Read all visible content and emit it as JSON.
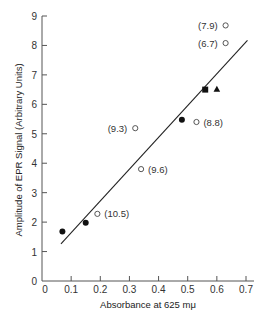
{
  "chart_data": {
    "type": "scatter",
    "title": "",
    "xlabel": "Absorbance at 625 mμ",
    "ylabel": "Amplitude of EPR Signal (Arbitrary Units)",
    "xlim": [
      0,
      0.7
    ],
    "ylim": [
      0,
      9
    ],
    "x_ticks": [
      0,
      0.1,
      0.2,
      0.3,
      0.4,
      0.5,
      0.6,
      0.7
    ],
    "x_tick_labels": [
      "0",
      "0.1",
      "0.2",
      "0.3",
      "0.4",
      "0.5",
      "0.6",
      "0.7"
    ],
    "y_ticks": [
      0,
      1,
      2,
      3,
      4,
      5,
      6,
      7,
      8,
      9
    ],
    "y_tick_labels": [
      "0",
      "1",
      "2",
      "3",
      "4",
      "5",
      "6",
      "7",
      "8",
      "9"
    ],
    "grid": false,
    "legend": null,
    "series": [
      {
        "name": "filled circles",
        "marker": "filled-circle",
        "points": [
          {
            "x": 0.07,
            "y": 1.68
          },
          {
            "x": 0.15,
            "y": 1.98
          },
          {
            "x": 0.48,
            "y": 5.48
          }
        ]
      },
      {
        "name": "open circles",
        "marker": "open-circle",
        "points": [
          {
            "x": 0.19,
            "y": 2.28,
            "label": "(10.5)"
          },
          {
            "x": 0.34,
            "y": 3.8,
            "label": "(9.6)"
          },
          {
            "x": 0.32,
            "y": 5.19,
            "label": "(9.3)"
          },
          {
            "x": 0.53,
            "y": 5.4,
            "label": "(8.8)"
          },
          {
            "x": 0.63,
            "y": 8.08,
            "label": "(6.7)"
          },
          {
            "x": 0.63,
            "y": 8.68,
            "label": "(7.9)"
          }
        ]
      },
      {
        "name": "filled square",
        "marker": "filled-square",
        "points": [
          {
            "x": 0.56,
            "y": 6.5
          }
        ]
      },
      {
        "name": "filled triangle",
        "marker": "filled-triangle",
        "points": [
          {
            "x": 0.6,
            "y": 6.51
          }
        ]
      }
    ],
    "fit_line": {
      "x1": 0.065,
      "y1": 1.26,
      "x2": 0.705,
      "y2": 8.17
    },
    "annotations": [
      {
        "text": "(10.5)",
        "x": 0.19,
        "y": 2.28,
        "side": "right"
      },
      {
        "text": "(9.6)",
        "x": 0.34,
        "y": 3.8,
        "side": "right"
      },
      {
        "text": "(9.3)",
        "x": 0.32,
        "y": 5.19,
        "side": "left"
      },
      {
        "text": "(8.8)",
        "x": 0.53,
        "y": 5.4,
        "side": "right"
      },
      {
        "text": "(6.7)",
        "x": 0.63,
        "y": 8.08,
        "side": "left"
      },
      {
        "text": "(7.9)",
        "x": 0.63,
        "y": 8.68,
        "side": "left"
      }
    ]
  }
}
